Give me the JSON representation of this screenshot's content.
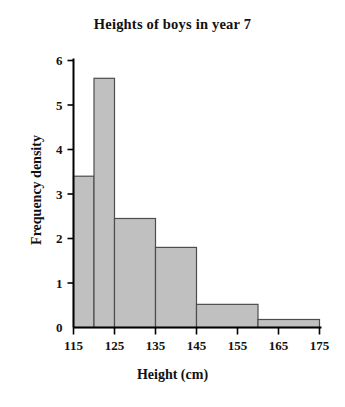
{
  "chart_data": {
    "type": "bar",
    "title": "Heights of boys in year 7",
    "xlabel": "Height (cm)",
    "ylabel": "Frequency density",
    "xlim": [
      115,
      175
    ],
    "ylim": [
      0,
      6
    ],
    "xticks": [
      115,
      125,
      135,
      145,
      155,
      165,
      175
    ],
    "yticks": [
      0,
      1,
      2,
      3,
      4,
      5,
      6
    ],
    "grid": false,
    "legend": null,
    "bar_color": "#c0c0c0",
    "bar_edge_color": "#4d4d4d",
    "axis_color": "#000000",
    "bins": [
      {
        "x_start": 115,
        "x_end": 120,
        "value": 3.4
      },
      {
        "x_start": 120,
        "x_end": 125,
        "value": 5.6
      },
      {
        "x_start": 125,
        "x_end": 135,
        "value": 2.45
      },
      {
        "x_start": 135,
        "x_end": 145,
        "value": 1.8
      },
      {
        "x_start": 145,
        "x_end": 160,
        "value": 0.52
      },
      {
        "x_start": 160,
        "x_end": 175,
        "value": 0.18
      }
    ],
    "categories": [
      "115-120",
      "120-125",
      "125-135",
      "135-145",
      "145-160",
      "160-175"
    ],
    "values": [
      3.4,
      5.6,
      2.45,
      1.8,
      0.52,
      0.18
    ]
  }
}
